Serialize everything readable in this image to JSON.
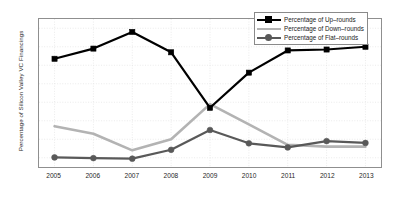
{
  "chart_data": {
    "type": "line",
    "title": "",
    "xlabel": "",
    "ylabel": "Percentage of Silicon Valley VC Financings",
    "x": [
      2005,
      2006,
      2007,
      2008,
      2009,
      2010,
      2011,
      2012,
      2013
    ],
    "categories": [
      "2005",
      "2006",
      "2007",
      "2008",
      "2009",
      "2010",
      "2011",
      "2012",
      "2013"
    ],
    "xtick_labels": [
      "2005",
      "2006",
      "2007",
      "2008",
      "2009",
      "2010",
      "2011",
      "2012",
      "2013"
    ],
    "ytick_labels": [
      "10%",
      "20%",
      "30%",
      "40%",
      "50%",
      "60%",
      "70%",
      "80%"
    ],
    "ytick_values": [
      10,
      20,
      30,
      40,
      50,
      60,
      70,
      80
    ],
    "xlim": [
      2004.6,
      2013.4
    ],
    "ylim": [
      5,
      85
    ],
    "grid": true,
    "legend_position": "top-right",
    "series": [
      {
        "name": "Percentage of Up-rounds",
        "legend_label": "Percentage of Up–rounds",
        "color": "#000000",
        "marker": "square",
        "values": [
          63.5,
          69.0,
          78.0,
          67.0,
          37.0,
          56.0,
          68.0,
          68.5,
          70.0
        ]
      },
      {
        "name": "Percentage of Down-rounds",
        "legend_label": "Percentage of Down–rounds",
        "color": "#b3b3b3",
        "marker": "none",
        "values": [
          27.0,
          23.0,
          14.0,
          20.0,
          39.0,
          28.0,
          17.0,
          16.0,
          16.0
        ]
      },
      {
        "name": "Percentage of Flat-rounds",
        "legend_label": "Percentage of Flat–rounds",
        "color": "#595959",
        "marker": "circle",
        "values": [
          10.2,
          9.8,
          9.5,
          14.3,
          25.0,
          17.8,
          15.6,
          19.0,
          18.0
        ]
      }
    ]
  },
  "legend": {
    "items": [
      {
        "label": "Percentage of Up–rounds"
      },
      {
        "label": "Percentage of Down–rounds"
      },
      {
        "label": "Percentage of Flat–rounds"
      }
    ]
  },
  "axes": {
    "y_title": "Percentage of Silicon Valley VC Financings"
  },
  "colors": {
    "up_rounds": "#000000",
    "down_rounds": "#b3b3b3",
    "flat_rounds": "#595959",
    "axis": "#8f8f8f",
    "grid": "#e2e2e2",
    "background": "#ffffff"
  }
}
